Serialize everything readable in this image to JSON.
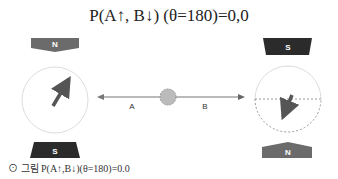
{
  "title": "P(A↑, B↓) (θ=180)=0,0",
  "left_detector": {
    "top_magnet": {
      "label": "N",
      "color": "#6b6b6b"
    },
    "bottom_magnet": {
      "label": "S",
      "color": "#2b2b2b"
    },
    "arrow_direction": "up-right"
  },
  "right_detector": {
    "top_magnet": {
      "label": "S",
      "color": "#2b2b2b"
    },
    "bottom_magnet": {
      "label": "N",
      "color": "#6b6b6b"
    },
    "arrow_direction": "down-left"
  },
  "beam": {
    "left_label": "A",
    "right_label": "B"
  },
  "caption": "⊙ 그림 P(A↑,B↓)(θ=180)=0.0"
}
